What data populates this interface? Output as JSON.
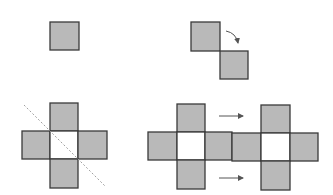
{
  "diagram": {
    "title": "",
    "colors": {
      "fill": "#b9b9b9",
      "stroke": "#3a3a3a",
      "empty": "#ffffff",
      "dashed": "#a0a0a0",
      "arrow": "#555555"
    },
    "panels": [
      {
        "id": "single-square",
        "description": "One shaded square"
      },
      {
        "id": "two-squares-rotate",
        "description": "Two diagonally touching squares with curved arrow"
      },
      {
        "id": "cross-with-axis",
        "description": "Cross of four shaded squares around empty center with dashed diagonal line"
      },
      {
        "id": "two-crosses-translate",
        "description": "Two adjacent crosses with horizontal arrows indicating translation"
      }
    ]
  }
}
